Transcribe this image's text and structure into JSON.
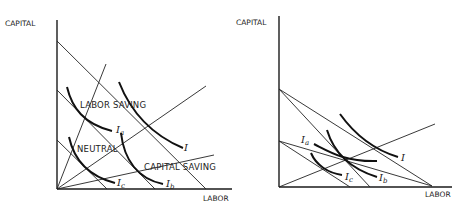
{
  "left_panel": {
    "y_axis_label": "CAPITAL",
    "x_axis_label": "LABOR",
    "region_labels": {
      "labor_saving": "LABOR SAVING",
      "neutral": "NEUTRAL",
      "capital_saving": "CAPITAL SAVING"
    },
    "isoquants": [
      {
        "base": "I",
        "sub": ""
      },
      {
        "base": "I",
        "sub": "a"
      },
      {
        "base": "I",
        "sub": "b"
      },
      {
        "base": "I",
        "sub": "c"
      }
    ]
  },
  "right_panel": {
    "y_axis_label": "CAPITAL",
    "x_axis_label": "LABOR",
    "isoquants": [
      {
        "base": "I",
        "sub": ""
      },
      {
        "base": "I",
        "sub": "a"
      },
      {
        "base": "I",
        "sub": "b"
      },
      {
        "base": "I",
        "sub": "c"
      }
    ]
  }
}
